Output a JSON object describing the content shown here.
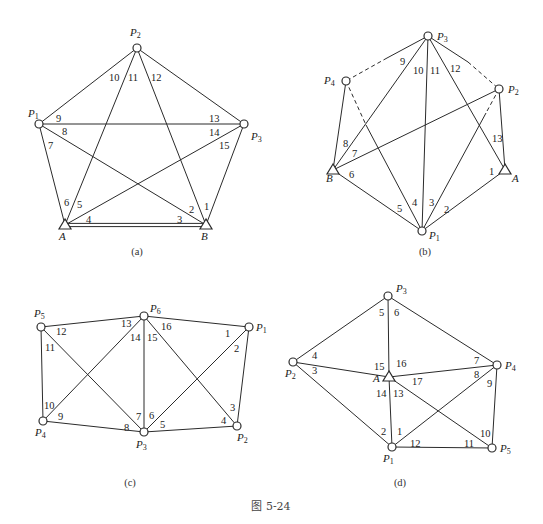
{
  "figure_caption": "图 5-24",
  "diagrams": [
    {
      "id": "a",
      "caption": "(a)",
      "caption_pos": [
        137,
        255
      ],
      "nodes": [
        {
          "name": "P",
          "sub": "2",
          "type": "circle",
          "x": 137,
          "y": 48,
          "lx": 130,
          "ly": 36
        },
        {
          "name": "P",
          "sub": "1",
          "type": "circle",
          "x": 39,
          "y": 124,
          "lx": 28,
          "ly": 117
        },
        {
          "name": "P",
          "sub": "3",
          "type": "circle",
          "x": 244,
          "y": 124,
          "lx": 251,
          "ly": 140
        },
        {
          "name": "A",
          "sub": "",
          "type": "triangle",
          "x": 65,
          "y": 225,
          "lx": 59,
          "ly": 240
        },
        {
          "name": "B",
          "sub": "",
          "type": "triangle",
          "x": 206,
          "y": 225,
          "lx": 201,
          "ly": 240
        }
      ],
      "edges": [
        {
          "from": [
            137,
            48
          ],
          "to": [
            39,
            124
          ],
          "style": "solid"
        },
        {
          "from": [
            137,
            48
          ],
          "to": [
            244,
            124
          ],
          "style": "solid"
        },
        {
          "from": [
            137,
            48
          ],
          "to": [
            65,
            225
          ],
          "style": "solid"
        },
        {
          "from": [
            137,
            48
          ],
          "to": [
            206,
            225
          ],
          "style": "solid"
        },
        {
          "from": [
            39,
            124
          ],
          "to": [
            244,
            124
          ],
          "style": "solid"
        },
        {
          "from": [
            39,
            124
          ],
          "to": [
            65,
            225
          ],
          "style": "solid"
        },
        {
          "from": [
            39,
            124
          ],
          "to": [
            206,
            225
          ],
          "style": "solid"
        },
        {
          "from": [
            244,
            124
          ],
          "to": [
            65,
            225
          ],
          "style": "solid"
        },
        {
          "from": [
            244,
            124
          ],
          "to": [
            206,
            225
          ],
          "style": "solid"
        },
        {
          "from": [
            65,
            225
          ],
          "to": [
            206,
            225
          ],
          "style": "double"
        }
      ],
      "labels": [
        {
          "text": "1",
          "x": 204,
          "y": 210
        },
        {
          "text": "2",
          "x": 189,
          "y": 213
        },
        {
          "text": "3",
          "x": 177,
          "y": 223
        },
        {
          "text": "4",
          "x": 86,
          "y": 223
        },
        {
          "text": "5",
          "x": 77,
          "y": 208
        },
        {
          "text": "6",
          "x": 64,
          "y": 206
        },
        {
          "text": "7",
          "x": 48,
          "y": 149
        },
        {
          "text": "8",
          "x": 62,
          "y": 135
        },
        {
          "text": "9",
          "x": 56,
          "y": 122
        },
        {
          "text": "10",
          "x": 109,
          "y": 81
        },
        {
          "text": "11",
          "x": 128,
          "y": 81
        },
        {
          "text": "12",
          "x": 151,
          "y": 81
        },
        {
          "text": "13",
          "x": 209,
          "y": 122
        },
        {
          "text": "14",
          "x": 209,
          "y": 136
        },
        {
          "text": "15",
          "x": 219,
          "y": 149
        }
      ]
    },
    {
      "id": "b",
      "caption": "(b)",
      "caption_pos": [
        425,
        255
      ],
      "nodes": [
        {
          "name": "P",
          "sub": "3",
          "type": "circle",
          "x": 428,
          "y": 36,
          "lx": 437,
          "ly": 40
        },
        {
          "name": "P",
          "sub": "4",
          "type": "circle",
          "x": 346,
          "y": 81,
          "lx": 324,
          "ly": 84
        },
        {
          "name": "P",
          "sub": "2",
          "type": "circle",
          "x": 499,
          "y": 89,
          "lx": 508,
          "ly": 93
        },
        {
          "name": "B",
          "sub": "",
          "type": "triangle",
          "x": 333,
          "y": 170,
          "lx": 326,
          "ly": 182
        },
        {
          "name": "A",
          "sub": "",
          "type": "triangle",
          "x": 505,
          "y": 170,
          "lx": 512,
          "ly": 182
        },
        {
          "name": "P",
          "sub": "1",
          "type": "circle",
          "x": 422,
          "y": 231,
          "lx": 429,
          "ly": 239
        }
      ],
      "edges": [
        {
          "from": [
            428,
            36
          ],
          "to": [
            387,
            58
          ],
          "style": "solid"
        },
        {
          "from": [
            387,
            58
          ],
          "to": [
            346,
            81
          ],
          "style": "dashed"
        },
        {
          "from": [
            428,
            36
          ],
          "to": [
            468,
            62
          ],
          "style": "solid"
        },
        {
          "from": [
            468,
            62
          ],
          "to": [
            499,
            89
          ],
          "style": "dashed"
        },
        {
          "from": [
            428,
            36
          ],
          "to": [
            333,
            170
          ],
          "style": "solid"
        },
        {
          "from": [
            428,
            36
          ],
          "to": [
            422,
            231
          ],
          "style": "solid"
        },
        {
          "from": [
            428,
            36
          ],
          "to": [
            505,
            170
          ],
          "style": "solid"
        },
        {
          "from": [
            346,
            81
          ],
          "to": [
            333,
            170
          ],
          "style": "solid"
        },
        {
          "from": [
            346,
            81
          ],
          "to": [
            366,
            125
          ],
          "style": "dashed"
        },
        {
          "from": [
            366,
            125
          ],
          "to": [
            422,
            231
          ],
          "style": "solid"
        },
        {
          "from": [
            499,
            89
          ],
          "to": [
            333,
            170
          ],
          "style": "solid"
        },
        {
          "from": [
            499,
            89
          ],
          "to": [
            505,
            170
          ],
          "style": "solid"
        },
        {
          "from": [
            499,
            89
          ],
          "to": [
            486,
            113
          ],
          "style": "dashed"
        },
        {
          "from": [
            486,
            113
          ],
          "to": [
            422,
            231
          ],
          "style": "solid"
        },
        {
          "from": [
            333,
            170
          ],
          "to": [
            422,
            231
          ],
          "style": "solid"
        },
        {
          "from": [
            505,
            170
          ],
          "to": [
            422,
            231
          ],
          "style": "solid"
        }
      ],
      "labels": [
        {
          "text": "1",
          "x": 489,
          "y": 175
        },
        {
          "text": "2",
          "x": 444,
          "y": 213
        },
        {
          "text": "3",
          "x": 429,
          "y": 206
        },
        {
          "text": "4",
          "x": 412,
          "y": 206
        },
        {
          "text": "5",
          "x": 397,
          "y": 212
        },
        {
          "text": "6",
          "x": 349,
          "y": 178
        },
        {
          "text": "7",
          "x": 352,
          "y": 157
        },
        {
          "text": "8",
          "x": 343,
          "y": 147
        },
        {
          "text": "9",
          "x": 400,
          "y": 65
        },
        {
          "text": "10",
          "x": 413,
          "y": 74
        },
        {
          "text": "11",
          "x": 430,
          "y": 74
        },
        {
          "text": "12",
          "x": 450,
          "y": 72
        },
        {
          "text": "13",
          "x": 492,
          "y": 142
        }
      ]
    },
    {
      "id": "c",
      "caption": "(c)",
      "caption_pos": [
        130,
        486
      ],
      "nodes": [
        {
          "name": "P",
          "sub": "5",
          "type": "circle",
          "x": 41,
          "y": 327,
          "lx": 34,
          "ly": 317
        },
        {
          "name": "P",
          "sub": "6",
          "type": "circle",
          "x": 144,
          "y": 316,
          "lx": 150,
          "ly": 312
        },
        {
          "name": "P",
          "sub": "1",
          "type": "circle",
          "x": 249,
          "y": 327,
          "lx": 256,
          "ly": 331
        },
        {
          "name": "P",
          "sub": "4",
          "type": "circle",
          "x": 43,
          "y": 421,
          "lx": 35,
          "ly": 436
        },
        {
          "name": "P",
          "sub": "3",
          "type": "circle",
          "x": 144,
          "y": 432,
          "lx": 136,
          "ly": 448
        },
        {
          "name": "P",
          "sub": "2",
          "type": "circle",
          "x": 237,
          "y": 426,
          "lx": 237,
          "ly": 441
        }
      ],
      "edges": [
        {
          "from": [
            41,
            327
          ],
          "to": [
            144,
            316
          ],
          "style": "solid"
        },
        {
          "from": [
            144,
            316
          ],
          "to": [
            249,
            327
          ],
          "style": "solid"
        },
        {
          "from": [
            41,
            327
          ],
          "to": [
            43,
            421
          ],
          "style": "solid"
        },
        {
          "from": [
            41,
            327
          ],
          "to": [
            144,
            432
          ],
          "style": "solid"
        },
        {
          "from": [
            144,
            316
          ],
          "to": [
            43,
            421
          ],
          "style": "solid"
        },
        {
          "from": [
            144,
            316
          ],
          "to": [
            144,
            432
          ],
          "style": "solid"
        },
        {
          "from": [
            144,
            316
          ],
          "to": [
            237,
            426
          ],
          "style": "solid"
        },
        {
          "from": [
            249,
            327
          ],
          "to": [
            144,
            432
          ],
          "style": "solid"
        },
        {
          "from": [
            249,
            327
          ],
          "to": [
            237,
            426
          ],
          "style": "solid"
        },
        {
          "from": [
            43,
            421
          ],
          "to": [
            144,
            432
          ],
          "style": "solid"
        },
        {
          "from": [
            144,
            432
          ],
          "to": [
            237,
            426
          ],
          "style": "solid"
        }
      ],
      "labels": [
        {
          "text": "1",
          "x": 225,
          "y": 337
        },
        {
          "text": "2",
          "x": 234,
          "y": 352
        },
        {
          "text": "3",
          "x": 230,
          "y": 411
        },
        {
          "text": "4",
          "x": 221,
          "y": 424
        },
        {
          "text": "5",
          "x": 160,
          "y": 428
        },
        {
          "text": "6",
          "x": 149,
          "y": 419
        },
        {
          "text": "7",
          "x": 136,
          "y": 420
        },
        {
          "text": "8",
          "x": 124,
          "y": 431
        },
        {
          "text": "9",
          "x": 58,
          "y": 420
        },
        {
          "text": "10",
          "x": 44,
          "y": 409
        },
        {
          "text": "11",
          "x": 45,
          "y": 351
        },
        {
          "text": "12",
          "x": 56,
          "y": 335
        },
        {
          "text": "13",
          "x": 121,
          "y": 327
        },
        {
          "text": "14",
          "x": 130,
          "y": 341
        },
        {
          "text": "15",
          "x": 147,
          "y": 341
        },
        {
          "text": "16",
          "x": 161,
          "y": 330
        }
      ]
    },
    {
      "id": "d",
      "caption": "(d)",
      "caption_pos": [
        400,
        486
      ],
      "nodes": [
        {
          "name": "P",
          "sub": "3",
          "type": "circle",
          "x": 388,
          "y": 296,
          "lx": 396,
          "ly": 292
        },
        {
          "name": "P",
          "sub": "2",
          "type": "circle",
          "x": 293,
          "y": 362,
          "lx": 285,
          "ly": 377
        },
        {
          "name": "A",
          "sub": "",
          "type": "triangle",
          "x": 389,
          "y": 377,
          "lx": 373,
          "ly": 382
        },
        {
          "name": "P",
          "sub": "4",
          "type": "circle",
          "x": 497,
          "y": 365,
          "lx": 505,
          "ly": 369
        },
        {
          "name": "P",
          "sub": "1",
          "type": "circle",
          "x": 392,
          "y": 447,
          "lx": 383,
          "ly": 462
        },
        {
          "name": "P",
          "sub": "5",
          "type": "circle",
          "x": 492,
          "y": 448,
          "lx": 500,
          "ly": 452
        }
      ],
      "edges": [
        {
          "from": [
            388,
            296
          ],
          "to": [
            293,
            362
          ],
          "style": "solid"
        },
        {
          "from": [
            388,
            296
          ],
          "to": [
            389,
            377
          ],
          "style": "solid"
        },
        {
          "from": [
            388,
            296
          ],
          "to": [
            497,
            365
          ],
          "style": "solid"
        },
        {
          "from": [
            293,
            362
          ],
          "to": [
            389,
            377
          ],
          "style": "solid"
        },
        {
          "from": [
            293,
            362
          ],
          "to": [
            392,
            447
          ],
          "style": "solid"
        },
        {
          "from": [
            389,
            377
          ],
          "to": [
            497,
            365
          ],
          "style": "solid"
        },
        {
          "from": [
            389,
            377
          ],
          "to": [
            392,
            447
          ],
          "style": "solid"
        },
        {
          "from": [
            389,
            377
          ],
          "to": [
            492,
            448
          ],
          "style": "solid"
        },
        {
          "from": [
            497,
            365
          ],
          "to": [
            392,
            447
          ],
          "style": "solid"
        },
        {
          "from": [
            497,
            365
          ],
          "to": [
            492,
            448
          ],
          "style": "solid"
        },
        {
          "from": [
            392,
            447
          ],
          "to": [
            492,
            448
          ],
          "style": "solid"
        }
      ],
      "labels": [
        {
          "text": "1",
          "x": 397,
          "y": 435
        },
        {
          "text": "2",
          "x": 381,
          "y": 435
        },
        {
          "text": "3",
          "x": 312,
          "y": 374
        },
        {
          "text": "4",
          "x": 312,
          "y": 359
        },
        {
          "text": "5",
          "x": 379,
          "y": 316
        },
        {
          "text": "6",
          "x": 394,
          "y": 316
        },
        {
          "text": "7",
          "x": 474,
          "y": 364
        },
        {
          "text": "8",
          "x": 474,
          "y": 378
        },
        {
          "text": "9",
          "x": 487,
          "y": 387
        },
        {
          "text": "10",
          "x": 480,
          "y": 437
        },
        {
          "text": "11",
          "x": 464,
          "y": 447
        },
        {
          "text": "12",
          "x": 410,
          "y": 447
        },
        {
          "text": "13",
          "x": 393,
          "y": 397
        },
        {
          "text": "14",
          "x": 376,
          "y": 397
        },
        {
          "text": "15",
          "x": 374,
          "y": 370
        },
        {
          "text": "16",
          "x": 396,
          "y": 367
        },
        {
          "text": "17",
          "x": 412,
          "y": 385
        }
      ]
    }
  ]
}
